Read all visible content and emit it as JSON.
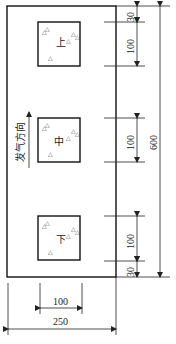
{
  "diagram": {
    "type": "specimen sampling layout",
    "direction_label": "发气方向",
    "zones": [
      {
        "label": "上"
      },
      {
        "label": "中"
      },
      {
        "label": "下"
      }
    ],
    "sample_marker": "△",
    "dimensions": {
      "vertical_segments": [
        "30",
        "100",
        "100",
        "100",
        "30"
      ],
      "total_height": "600",
      "square_width": "100",
      "total_width": "250"
    }
  }
}
